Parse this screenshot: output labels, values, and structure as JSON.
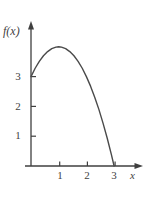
{
  "chart_data": {
    "type": "line",
    "title": "",
    "xlabel": "x",
    "ylabel": "f(x)",
    "xlim": [
      0,
      3.7
    ],
    "ylim": [
      0,
      4.9
    ],
    "grid": false,
    "legend": null,
    "x_ticks": [
      "1",
      "2",
      "3"
    ],
    "x_tick_values": [
      1,
      2,
      3
    ],
    "y_ticks": [
      "3",
      "2",
      "1"
    ],
    "y_tick_values": [
      3,
      2,
      1
    ],
    "series": [
      {
        "name": "f(x)",
        "color": "#4a4a4a",
        "x": [
          0,
          0.15,
          0.3,
          0.45,
          0.6,
          0.75,
          0.9,
          1.0,
          1.1,
          1.25,
          1.4,
          1.55,
          1.7,
          1.85,
          2.0,
          2.15,
          2.3,
          2.45,
          2.6,
          2.75,
          2.9,
          3.0
        ],
        "y": [
          3.0,
          3.28,
          3.51,
          3.7,
          3.84,
          3.94,
          3.99,
          4.0,
          3.99,
          3.94,
          3.84,
          3.7,
          3.51,
          3.28,
          3.0,
          2.68,
          2.31,
          1.9,
          1.44,
          0.94,
          0.39,
          0.0
        ]
      }
    ],
    "annotations": {
      "y_intercept": 3,
      "peak": {
        "x": 1,
        "y": 4
      },
      "x_intercept": 3
    }
  },
  "axes": {
    "y_axis_label": "f(x)",
    "x_axis_label": "x",
    "y_tick_labels": [
      "3",
      "2",
      "1"
    ],
    "x_tick_labels": [
      "1",
      "2",
      "3"
    ]
  },
  "style": {
    "background": "#ffffff",
    "curve_color": "#4a4a4a",
    "axis_color": "#3f3f3f",
    "text_color": "#3f3f3f"
  }
}
